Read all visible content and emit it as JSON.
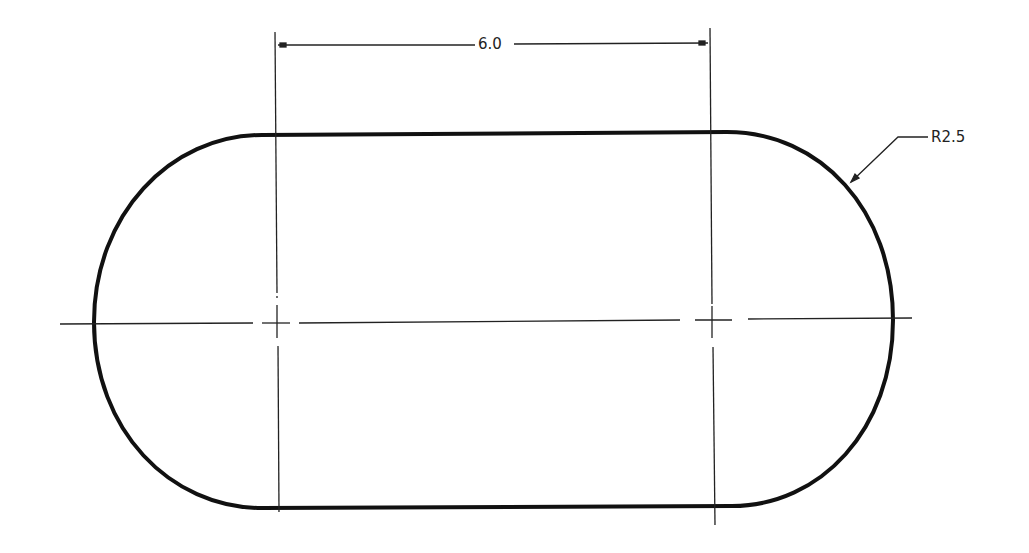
{
  "drawing": {
    "type": "slot / obround technical drawing",
    "colors": {
      "outline": "#111111",
      "thin_line": "#222222",
      "background": "#ffffff"
    },
    "dimensions": {
      "linear": {
        "label": "6.0",
        "description": "center-to-center distance between arc centers"
      },
      "radius": {
        "label": "R2.5",
        "description": "radius of end arcs (leader to right arc)"
      }
    },
    "centerlines": {
      "horizontal": "dash centerline through both arc centers",
      "vertical_left": "extension/center line at left arc center",
      "vertical_right": "extension/center line at right arc center"
    }
  }
}
